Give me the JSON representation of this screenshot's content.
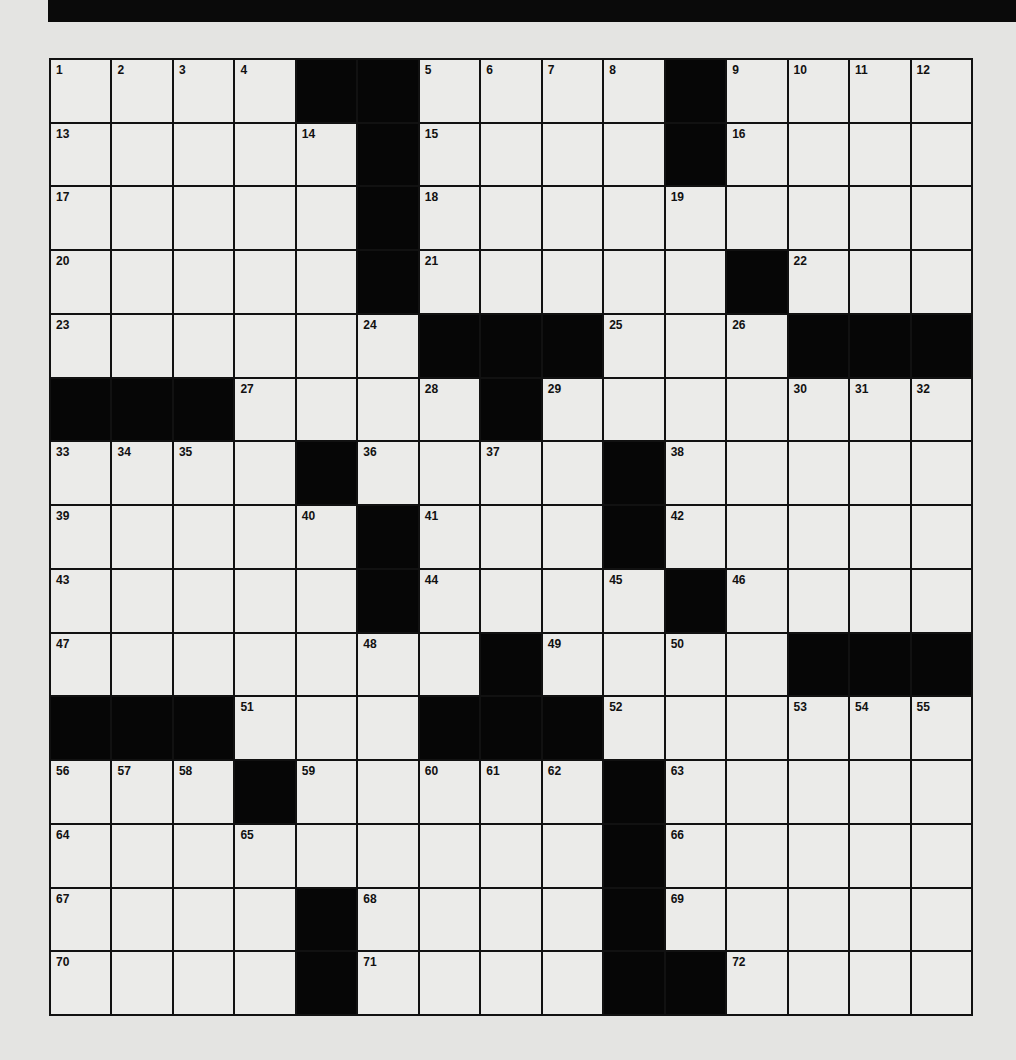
{
  "puzzle": {
    "rows": 15,
    "cols": 15,
    "layout": [
      "....##....#....",
      ".....#....#....",
      ".....#.........",
      ".....#.....#...",
      "......###...###",
      "###....#.......",
      "....#....#.....",
      ".....#...#.....",
      ".....#....#....",
      ".......#....###",
      "###...###......",
      "...#.....#.....",
      ".........#.....",
      "....#....#.....",
      "....#....##...."
    ],
    "numbers": [
      [
        0,
        0,
        1
      ],
      [
        0,
        1,
        2
      ],
      [
        0,
        2,
        3
      ],
      [
        0,
        3,
        4
      ],
      [
        0,
        6,
        5
      ],
      [
        0,
        7,
        6
      ],
      [
        0,
        8,
        7
      ],
      [
        0,
        9,
        8
      ],
      [
        0,
        11,
        9
      ],
      [
        0,
        12,
        10
      ],
      [
        0,
        13,
        11
      ],
      [
        0,
        14,
        12
      ],
      [
        1,
        0,
        13
      ],
      [
        1,
        4,
        14
      ],
      [
        1,
        6,
        15
      ],
      [
        1,
        11,
        16
      ],
      [
        2,
        0,
        17
      ],
      [
        2,
        6,
        18
      ],
      [
        2,
        10,
        19
      ],
      [
        3,
        0,
        20
      ],
      [
        3,
        6,
        21
      ],
      [
        3,
        12,
        22
      ],
      [
        4,
        0,
        23
      ],
      [
        4,
        5,
        24
      ],
      [
        4,
        9,
        25
      ],
      [
        4,
        11,
        26
      ],
      [
        5,
        3,
        27
      ],
      [
        5,
        6,
        28
      ],
      [
        5,
        8,
        29
      ],
      [
        5,
        12,
        30
      ],
      [
        5,
        13,
        31
      ],
      [
        5,
        14,
        32
      ],
      [
        6,
        0,
        33
      ],
      [
        6,
        1,
        34
      ],
      [
        6,
        2,
        35
      ],
      [
        6,
        5,
        36
      ],
      [
        6,
        7,
        37
      ],
      [
        6,
        10,
        38
      ],
      [
        7,
        0,
        39
      ],
      [
        7,
        4,
        40
      ],
      [
        7,
        6,
        41
      ],
      [
        7,
        10,
        42
      ],
      [
        8,
        0,
        43
      ],
      [
        8,
        6,
        44
      ],
      [
        8,
        9,
        45
      ],
      [
        8,
        11,
        46
      ],
      [
        9,
        0,
        47
      ],
      [
        9,
        5,
        48
      ],
      [
        9,
        8,
        49
      ],
      [
        9,
        10,
        50
      ],
      [
        10,
        3,
        51
      ],
      [
        10,
        9,
        52
      ],
      [
        10,
        12,
        53
      ],
      [
        10,
        13,
        54
      ],
      [
        10,
        14,
        55
      ],
      [
        11,
        0,
        56
      ],
      [
        11,
        1,
        57
      ],
      [
        11,
        2,
        58
      ],
      [
        11,
        4,
        59
      ],
      [
        11,
        6,
        60
      ],
      [
        11,
        7,
        61
      ],
      [
        11,
        8,
        62
      ],
      [
        11,
        10,
        63
      ],
      [
        12,
        0,
        64
      ],
      [
        12,
        3,
        65
      ],
      [
        12,
        10,
        66
      ],
      [
        13,
        0,
        67
      ],
      [
        13,
        5,
        68
      ],
      [
        13,
        10,
        69
      ],
      [
        14,
        0,
        70
      ],
      [
        14,
        5,
        71
      ],
      [
        14,
        11,
        72
      ]
    ],
    "colors": {
      "black_square": "#060606",
      "white_square": "#ebebe9",
      "grid_line": "#111111",
      "page_background": "#e4e4e2"
    }
  }
}
